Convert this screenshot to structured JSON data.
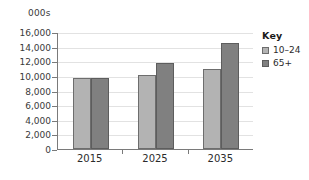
{
  "chart_data": {
    "type": "bar",
    "title": "",
    "subtitle": "",
    "units_label": "000s",
    "xlabel": "",
    "ylabel": "",
    "categories": [
      "2015",
      "2025",
      "2035"
    ],
    "series": [
      {
        "name": "10–24",
        "values": [
          9700,
          10100,
          10900
        ],
        "color": "#b3b3b3"
      },
      {
        "name": "65+",
        "values": [
          9700,
          11800,
          14500
        ],
        "color": "#808080"
      }
    ],
    "ylim": [
      0,
      16000
    ],
    "ytick_values": [
      0,
      2000,
      4000,
      6000,
      8000,
      10000,
      12000,
      14000,
      16000
    ],
    "ytick_labels": [
      "0",
      "2,000",
      "4,000",
      "6,000",
      "8,000",
      "10,000",
      "12,000",
      "14,000",
      "16,000"
    ],
    "grid": true,
    "legend_position": "right"
  },
  "legend": {
    "title": "Key",
    "entries": [
      {
        "label": "10–24",
        "swatch": "light"
      },
      {
        "label": "65+",
        "swatch": "dark"
      }
    ]
  }
}
